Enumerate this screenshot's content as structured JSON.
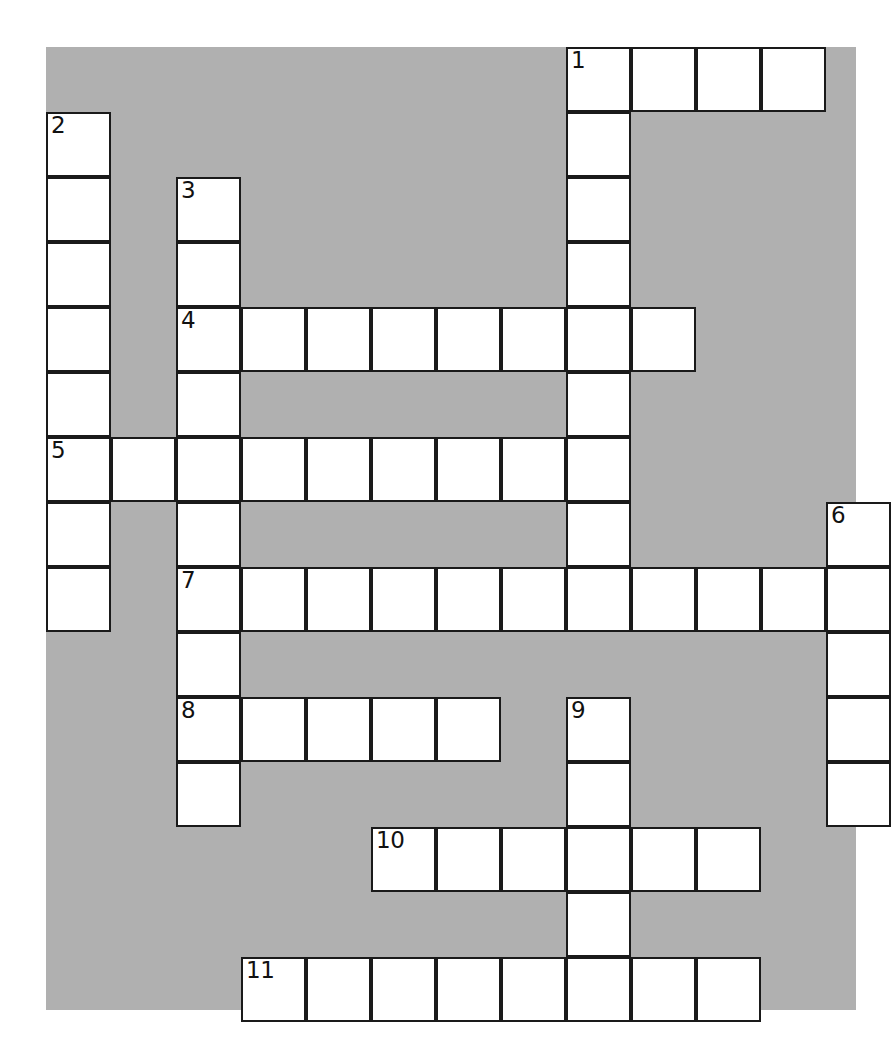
{
  "puzzle": {
    "kind": "crossword-grid",
    "panel": {
      "background_color": "#b0b0b0",
      "left": 46,
      "top": 47,
      "width": 810,
      "height": 963
    },
    "page_background_color": "#ffffff",
    "cell_border_color": "#1a1a1a",
    "cell_fill_color": "#ffffff",
    "cell_size": 65,
    "columns": 13,
    "rows": 15,
    "origin": {
      "x": 46,
      "y": 47
    },
    "entries": [
      {
        "number": "1",
        "direction": "across",
        "col": 9,
        "row": 1,
        "length": 4
      },
      {
        "number": "1",
        "direction": "down",
        "col": 9,
        "row": 1,
        "length": 8
      },
      {
        "number": "2",
        "direction": "down",
        "col": 1,
        "row": 2,
        "length": 8
      },
      {
        "number": "3",
        "direction": "down",
        "col": 3,
        "row": 3,
        "length": 9
      },
      {
        "number": "4",
        "direction": "across",
        "col": 3,
        "row": 5,
        "length": 8
      },
      {
        "number": "5",
        "direction": "across",
        "col": 1,
        "row": 7,
        "length": 9
      },
      {
        "number": "6",
        "direction": "down",
        "col": 13,
        "row": 8,
        "length": 5
      },
      {
        "number": "7",
        "direction": "across",
        "col": 3,
        "row": 9,
        "length": 11
      },
      {
        "number": "8",
        "direction": "across",
        "col": 3,
        "row": 11,
        "length": 5
      },
      {
        "number": "9",
        "direction": "down",
        "col": 9,
        "row": 11,
        "length": 5
      },
      {
        "number": "10",
        "direction": "across",
        "col": 6,
        "row": 13,
        "length": 6
      },
      {
        "number": "11",
        "direction": "across",
        "col": 4,
        "row": 15,
        "length": 8
      }
    ],
    "numbered_cells": [
      {
        "label": "1",
        "col": 9,
        "row": 1
      },
      {
        "label": "2",
        "col": 1,
        "row": 2
      },
      {
        "label": "3",
        "col": 3,
        "row": 3
      },
      {
        "label": "4",
        "col": 3,
        "row": 5
      },
      {
        "label": "5",
        "col": 1,
        "row": 7
      },
      {
        "label": "6",
        "col": 13,
        "row": 8
      },
      {
        "label": "7",
        "col": 3,
        "row": 9
      },
      {
        "label": "8",
        "col": 3,
        "row": 11
      },
      {
        "label": "9",
        "col": 9,
        "row": 11
      },
      {
        "label": "10",
        "col": 6,
        "row": 13
      },
      {
        "label": "11",
        "col": 4,
        "row": 15
      }
    ],
    "cells": [
      {
        "col": 9,
        "row": 1,
        "number": "1",
        "letter": ""
      },
      {
        "col": 10,
        "row": 1,
        "number": "",
        "letter": ""
      },
      {
        "col": 11,
        "row": 1,
        "number": "",
        "letter": ""
      },
      {
        "col": 12,
        "row": 1,
        "number": "",
        "letter": ""
      },
      {
        "col": 1,
        "row": 2,
        "number": "2",
        "letter": ""
      },
      {
        "col": 9,
        "row": 2,
        "number": "",
        "letter": ""
      },
      {
        "col": 1,
        "row": 3,
        "number": "",
        "letter": ""
      },
      {
        "col": 3,
        "row": 3,
        "number": "3",
        "letter": ""
      },
      {
        "col": 9,
        "row": 3,
        "number": "",
        "letter": ""
      },
      {
        "col": 1,
        "row": 4,
        "number": "",
        "letter": ""
      },
      {
        "col": 3,
        "row": 4,
        "number": "",
        "letter": ""
      },
      {
        "col": 9,
        "row": 4,
        "number": "",
        "letter": ""
      },
      {
        "col": 1,
        "row": 5,
        "number": "",
        "letter": ""
      },
      {
        "col": 3,
        "row": 5,
        "number": "4",
        "letter": ""
      },
      {
        "col": 4,
        "row": 5,
        "number": "",
        "letter": ""
      },
      {
        "col": 5,
        "row": 5,
        "number": "",
        "letter": ""
      },
      {
        "col": 6,
        "row": 5,
        "number": "",
        "letter": ""
      },
      {
        "col": 7,
        "row": 5,
        "number": "",
        "letter": ""
      },
      {
        "col": 8,
        "row": 5,
        "number": "",
        "letter": ""
      },
      {
        "col": 9,
        "row": 5,
        "number": "",
        "letter": ""
      },
      {
        "col": 10,
        "row": 5,
        "number": "",
        "letter": ""
      },
      {
        "col": 1,
        "row": 6,
        "number": "",
        "letter": ""
      },
      {
        "col": 3,
        "row": 6,
        "number": "",
        "letter": ""
      },
      {
        "col": 9,
        "row": 6,
        "number": "",
        "letter": ""
      },
      {
        "col": 1,
        "row": 7,
        "number": "5",
        "letter": ""
      },
      {
        "col": 2,
        "row": 7,
        "number": "",
        "letter": ""
      },
      {
        "col": 3,
        "row": 7,
        "number": "",
        "letter": ""
      },
      {
        "col": 4,
        "row": 7,
        "number": "",
        "letter": ""
      },
      {
        "col": 5,
        "row": 7,
        "number": "",
        "letter": ""
      },
      {
        "col": 6,
        "row": 7,
        "number": "",
        "letter": ""
      },
      {
        "col": 7,
        "row": 7,
        "number": "",
        "letter": ""
      },
      {
        "col": 8,
        "row": 7,
        "number": "",
        "letter": ""
      },
      {
        "col": 9,
        "row": 7,
        "number": "",
        "letter": ""
      },
      {
        "col": 1,
        "row": 8,
        "number": "",
        "letter": ""
      },
      {
        "col": 3,
        "row": 8,
        "number": "",
        "letter": ""
      },
      {
        "col": 9,
        "row": 8,
        "number": "",
        "letter": ""
      },
      {
        "col": 13,
        "row": 8,
        "number": "6",
        "letter": ""
      },
      {
        "col": 1,
        "row": 9,
        "number": "",
        "letter": ""
      },
      {
        "col": 3,
        "row": 9,
        "number": "7",
        "letter": ""
      },
      {
        "col": 4,
        "row": 9,
        "number": "",
        "letter": ""
      },
      {
        "col": 5,
        "row": 9,
        "number": "",
        "letter": ""
      },
      {
        "col": 6,
        "row": 9,
        "number": "",
        "letter": ""
      },
      {
        "col": 7,
        "row": 9,
        "number": "",
        "letter": ""
      },
      {
        "col": 8,
        "row": 9,
        "number": "",
        "letter": ""
      },
      {
        "col": 9,
        "row": 9,
        "number": "",
        "letter": ""
      },
      {
        "col": 10,
        "row": 9,
        "number": "",
        "letter": ""
      },
      {
        "col": 11,
        "row": 9,
        "number": "",
        "letter": ""
      },
      {
        "col": 12,
        "row": 9,
        "number": "",
        "letter": ""
      },
      {
        "col": 13,
        "row": 9,
        "number": "",
        "letter": ""
      },
      {
        "col": 3,
        "row": 10,
        "number": "",
        "letter": ""
      },
      {
        "col": 13,
        "row": 10,
        "number": "",
        "letter": ""
      },
      {
        "col": 3,
        "row": 11,
        "number": "8",
        "letter": ""
      },
      {
        "col": 4,
        "row": 11,
        "number": "",
        "letter": ""
      },
      {
        "col": 5,
        "row": 11,
        "number": "",
        "letter": ""
      },
      {
        "col": 6,
        "row": 11,
        "number": "",
        "letter": ""
      },
      {
        "col": 7,
        "row": 11,
        "number": "",
        "letter": ""
      },
      {
        "col": 9,
        "row": 11,
        "number": "9",
        "letter": ""
      },
      {
        "col": 13,
        "row": 11,
        "number": "",
        "letter": ""
      },
      {
        "col": 3,
        "row": 12,
        "number": "",
        "letter": ""
      },
      {
        "col": 9,
        "row": 12,
        "number": "",
        "letter": ""
      },
      {
        "col": 13,
        "row": 12,
        "number": "",
        "letter": ""
      },
      {
        "col": 6,
        "row": 13,
        "number": "10",
        "letter": ""
      },
      {
        "col": 7,
        "row": 13,
        "number": "",
        "letter": ""
      },
      {
        "col": 8,
        "row": 13,
        "number": "",
        "letter": ""
      },
      {
        "col": 9,
        "row": 13,
        "number": "",
        "letter": ""
      },
      {
        "col": 10,
        "row": 13,
        "number": "",
        "letter": ""
      },
      {
        "col": 11,
        "row": 13,
        "number": "",
        "letter": ""
      },
      {
        "col": 9,
        "row": 14,
        "number": "",
        "letter": ""
      },
      {
        "col": 4,
        "row": 15,
        "number": "11",
        "letter": ""
      },
      {
        "col": 5,
        "row": 15,
        "number": "",
        "letter": ""
      },
      {
        "col": 6,
        "row": 15,
        "number": "",
        "letter": ""
      },
      {
        "col": 7,
        "row": 15,
        "number": "",
        "letter": ""
      },
      {
        "col": 8,
        "row": 15,
        "number": "",
        "letter": ""
      },
      {
        "col": 9,
        "row": 15,
        "number": "",
        "letter": ""
      },
      {
        "col": 10,
        "row": 15,
        "number": "",
        "letter": ""
      },
      {
        "col": 11,
        "row": 15,
        "number": "",
        "letter": ""
      }
    ]
  }
}
